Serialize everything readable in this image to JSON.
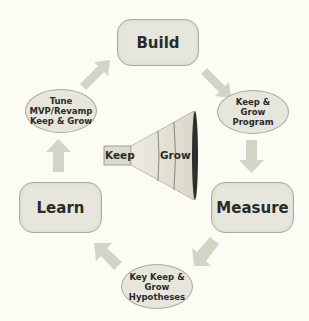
{
  "diagram": {
    "type": "cycle",
    "stages": [
      {
        "id": "build",
        "label": "Build",
        "shape": "rounded-rectangle"
      },
      {
        "id": "keep-grow-program",
        "label": "Keep &\nGrow\nProgram",
        "shape": "ellipse"
      },
      {
        "id": "measure",
        "label": "Measure",
        "shape": "rounded-rectangle"
      },
      {
        "id": "key-hypotheses",
        "label": "Key Keep &\nGrow\nHypotheses",
        "shape": "ellipse"
      },
      {
        "id": "learn",
        "label": "Learn",
        "shape": "rounded-rectangle"
      },
      {
        "id": "tune",
        "label": "Tune\nMVP/Revamp\nKeep & Grow",
        "shape": "ellipse"
      }
    ],
    "flow": [
      "build",
      "keep-grow-program",
      "measure",
      "key-hypotheses",
      "learn",
      "tune",
      "build"
    ],
    "funnel": {
      "keep_label": "Keep",
      "grow_label": "Grow"
    }
  },
  "colors": {
    "background": "#fcfcf4",
    "node_fill": "#e6e6dc",
    "node_border": "#a9a99e",
    "arrow": "#d3d3c6",
    "text": "#2a2a2a"
  }
}
